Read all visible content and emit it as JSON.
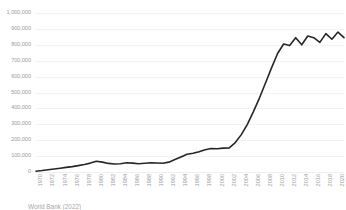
{
  "chart_data": {
    "type": "line",
    "title": "",
    "xlabel": "",
    "ylabel": "",
    "ylim": [
      0,
      1000000
    ],
    "xlim": [
      1970,
      2021
    ],
    "grid": "horizontal",
    "legend": "none",
    "line_color": "#262626",
    "gridline_color": "#f2f2f2",
    "tick_label_color": "#9a9a9a",
    "y_ticks": [
      "0",
      "100,000",
      "200,000",
      "300,000",
      "400,000",
      "500,000",
      "600,000",
      "700,000",
      "800,000",
      "900,000",
      "1,000,000"
    ],
    "y_tick_values": [
      0,
      100000,
      200000,
      300000,
      400000,
      500000,
      600000,
      700000,
      800000,
      900000,
      1000000
    ],
    "x_tick_labels": [
      "1970",
      "1972",
      "1974",
      "1976",
      "1978",
      "1980",
      "1982",
      "1984",
      "1986",
      "1988",
      "1990",
      "1992",
      "1994",
      "1996",
      "1998",
      "2000",
      "2002",
      "2004",
      "2006",
      "2008",
      "2010",
      "2012",
      "2014",
      "2016",
      "2018",
      "2020"
    ],
    "x": [
      1970,
      1971,
      1972,
      1973,
      1974,
      1975,
      1976,
      1977,
      1978,
      1979,
      1980,
      1981,
      1982,
      1983,
      1984,
      1985,
      1986,
      1987,
      1988,
      1989,
      1990,
      1991,
      1992,
      1993,
      1994,
      1995,
      1996,
      1997,
      1998,
      1999,
      2000,
      2001,
      2002,
      2003,
      2004,
      2005,
      2006,
      2007,
      2008,
      2009,
      2010,
      2011,
      2012,
      2013,
      2014,
      2015,
      2016,
      2017,
      2018,
      2019,
      2020,
      2021
    ],
    "values": [
      5000,
      9000,
      14000,
      19000,
      24000,
      29000,
      34000,
      40000,
      47000,
      56000,
      68000,
      62000,
      54000,
      50000,
      52000,
      58000,
      56000,
      52000,
      55000,
      58000,
      57000,
      55000,
      62000,
      78000,
      95000,
      112000,
      118000,
      128000,
      140000,
      148000,
      146000,
      150000,
      152000,
      185000,
      235000,
      300000,
      380000,
      465000,
      560000,
      655000,
      745000,
      805000,
      795000,
      845000,
      800000,
      855000,
      845000,
      815000,
      870000,
      835000,
      880000,
      845000
    ]
  },
  "caption": {
    "text": "World Bank (2022)"
  }
}
